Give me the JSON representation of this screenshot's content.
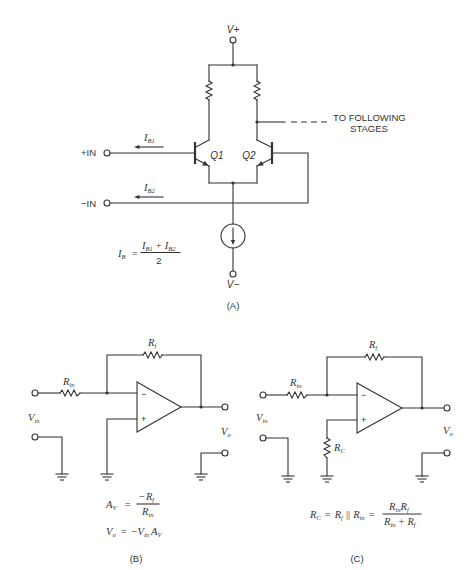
{
  "panel_a": {
    "caption": "(A)",
    "v_pos": "V+",
    "v_neg": "V−",
    "plus_in": "+IN",
    "minus_in": "−IN",
    "q1": "Q1",
    "q2": "Q2",
    "ib1": {
      "sym": "I",
      "sub": "B1"
    },
    "ib2": {
      "sym": "I",
      "sub": "B2"
    },
    "output_note": {
      "line1": "TO FOLLOWING",
      "line2": "STAGES"
    },
    "formula": {
      "lhs": {
        "sym": "I",
        "sub": "B"
      },
      "eq": "=",
      "num_a": {
        "sym": "I",
        "sub": "B1"
      },
      "num_op": "+",
      "num_b": {
        "sym": "I",
        "sub": "B2"
      },
      "den": "2"
    }
  },
  "panel_b": {
    "caption": "(B)",
    "rin": {
      "sym": "R",
      "sub": "in"
    },
    "rf": {
      "sym": "R",
      "sub": "f"
    },
    "vin": {
      "sym": "V",
      "sub": "in"
    },
    "vo": {
      "sym": "V",
      "sub": "o"
    },
    "opamp": {
      "inverting": "−",
      "noninverting": "+"
    },
    "gain_formula": {
      "lhs": {
        "sym": "A",
        "sub": "V"
      },
      "eq": "=",
      "num": {
        "neg": "−",
        "sym": "R",
        "sub": "f"
      },
      "den": {
        "sym": "R",
        "sub": "in"
      }
    },
    "output_formula": {
      "lhs": {
        "sym": "V",
        "sub": "o"
      },
      "eq": "=",
      "neg": "−",
      "t1": {
        "sym": "V",
        "sub": "in"
      },
      "t2": {
        "sym": "A",
        "sub": "V"
      }
    }
  },
  "panel_c": {
    "caption": "(C)",
    "rin": {
      "sym": "R",
      "sub": "in"
    },
    "rf": {
      "sym": "R",
      "sub": "f"
    },
    "rc": {
      "sym": "R",
      "sub": "C"
    },
    "vin": {
      "sym": "V",
      "sub": "in"
    },
    "vo": {
      "sym": "V",
      "sub": "o"
    },
    "opamp": {
      "inverting": "−",
      "noninverting": "+"
    },
    "formula": {
      "lhs": {
        "sym": "R",
        "sub": "C"
      },
      "eq1": "=",
      "t1": {
        "sym": "R",
        "sub": "f"
      },
      "parallel": "||",
      "t2": {
        "sym": "R",
        "sub": "in"
      },
      "eq2": "=",
      "num_a": {
        "sym": "R",
        "sub": "in"
      },
      "num_b": {
        "sym": "R",
        "sub": "f"
      },
      "den_a": {
        "sym": "R",
        "sub": "in"
      },
      "den_op": "+",
      "den_b": {
        "sym": "R",
        "sub": "f"
      }
    }
  }
}
